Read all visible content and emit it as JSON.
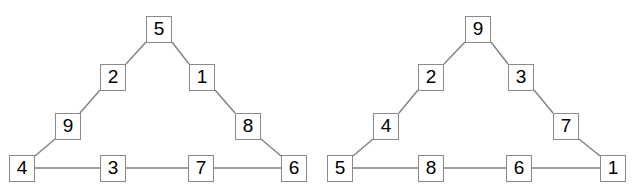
{
  "figure": {
    "title": "",
    "background_color": "#ffffff",
    "edge_color": "#808080",
    "node_border_color": "#8a8a8a",
    "node_fill_color": "#ffffff",
    "digit_color": "#000000",
    "diagram_type": "magic-triangle-pair",
    "panels": [
      {
        "name": "left-triangle",
        "nodes": [
          {
            "id": "L-apex",
            "label": "5",
            "x": 146,
            "y": 16,
            "role": "apex"
          },
          {
            "id": "L-left-upper",
            "label": "2",
            "x": 100,
            "y": 64,
            "role": "left-side"
          },
          {
            "id": "L-right-upper",
            "label": "1",
            "x": 189,
            "y": 64,
            "role": "right-side"
          },
          {
            "id": "L-left-lower",
            "label": "9",
            "x": 55,
            "y": 113,
            "role": "left-side"
          },
          {
            "id": "L-right-lower",
            "label": "8",
            "x": 235,
            "y": 113,
            "role": "right-side"
          },
          {
            "id": "L-bottom-1",
            "label": "4",
            "x": 9,
            "y": 155,
            "role": "corner-bottom-left"
          },
          {
            "id": "L-bottom-2",
            "label": "3",
            "x": 100,
            "y": 155,
            "role": "bottom"
          },
          {
            "id": "L-bottom-3",
            "label": "7",
            "x": 188,
            "y": 155,
            "role": "bottom"
          },
          {
            "id": "L-bottom-4",
            "label": "6",
            "x": 281,
            "y": 155,
            "role": "corner-bottom-right"
          }
        ],
        "edges": [
          {
            "from": "L-bottom-1",
            "to": "L-left-lower",
            "x1": 35,
            "y1": 156,
            "x2": 55,
            "y2": 139
          },
          {
            "from": "L-left-lower",
            "to": "L-left-upper",
            "x1": 80,
            "y1": 113,
            "x2": 100,
            "y2": 90
          },
          {
            "from": "L-left-upper",
            "to": "L-apex",
            "x1": 126,
            "y1": 64,
            "x2": 146,
            "y2": 42
          },
          {
            "from": "L-apex",
            "to": "L-right-upper",
            "x1": 172,
            "y1": 42,
            "x2": 189,
            "y2": 64
          },
          {
            "from": "L-right-upper",
            "to": "L-right-lower",
            "x1": 215,
            "y1": 90,
            "x2": 235,
            "y2": 113
          },
          {
            "from": "L-right-lower",
            "to": "L-bottom-4",
            "x1": 261,
            "y1": 139,
            "x2": 281,
            "y2": 156
          },
          {
            "from": "L-bottom-1",
            "to": "L-bottom-2",
            "x1": 35,
            "y1": 168,
            "x2": 100,
            "y2": 168
          },
          {
            "from": "L-bottom-2",
            "to": "L-bottom-3",
            "x1": 126,
            "y1": 168,
            "x2": 188,
            "y2": 168
          },
          {
            "from": "L-bottom-3",
            "to": "L-bottom-4",
            "x1": 214,
            "y1": 168,
            "x2": 281,
            "y2": 168
          }
        ]
      },
      {
        "name": "right-triangle",
        "nodes": [
          {
            "id": "R-apex",
            "label": "9",
            "x": 465,
            "y": 16,
            "role": "apex"
          },
          {
            "id": "R-left-upper",
            "label": "2",
            "x": 418,
            "y": 64,
            "role": "left-side"
          },
          {
            "id": "R-right-upper",
            "label": "3",
            "x": 508,
            "y": 64,
            "role": "right-side"
          },
          {
            "id": "R-left-lower",
            "label": "4",
            "x": 373,
            "y": 113,
            "role": "left-side"
          },
          {
            "id": "R-right-lower",
            "label": "7",
            "x": 553,
            "y": 113,
            "role": "right-side"
          },
          {
            "id": "R-bottom-1",
            "label": "5",
            "x": 327,
            "y": 155,
            "role": "corner-bottom-left"
          },
          {
            "id": "R-bottom-2",
            "label": "8",
            "x": 418,
            "y": 155,
            "role": "bottom"
          },
          {
            "id": "R-bottom-3",
            "label": "6",
            "x": 506,
            "y": 155,
            "role": "bottom"
          },
          {
            "id": "R-bottom-4",
            "label": "1",
            "x": 600,
            "y": 155,
            "role": "corner-bottom-right"
          }
        ],
        "edges": [
          {
            "from": "R-bottom-1",
            "to": "R-left-lower",
            "x1": 353,
            "y1": 156,
            "x2": 373,
            "y2": 139
          },
          {
            "from": "R-left-lower",
            "to": "R-left-upper",
            "x1": 399,
            "y1": 113,
            "x2": 418,
            "y2": 90
          },
          {
            "from": "R-left-upper",
            "to": "R-apex",
            "x1": 444,
            "y1": 64,
            "x2": 465,
            "y2": 42
          },
          {
            "from": "R-apex",
            "to": "R-right-upper",
            "x1": 491,
            "y1": 42,
            "x2": 508,
            "y2": 64
          },
          {
            "from": "R-right-upper",
            "to": "R-right-lower",
            "x1": 534,
            "y1": 90,
            "x2": 553,
            "y2": 113
          },
          {
            "from": "R-right-lower",
            "to": "R-bottom-4",
            "x1": 579,
            "y1": 139,
            "x2": 600,
            "y2": 156
          },
          {
            "from": "R-bottom-1",
            "to": "R-bottom-2",
            "x1": 353,
            "y1": 168,
            "x2": 418,
            "y2": 168
          },
          {
            "from": "R-bottom-2",
            "to": "R-bottom-3",
            "x1": 444,
            "y1": 168,
            "x2": 506,
            "y2": 168
          },
          {
            "from": "R-bottom-3",
            "to": "R-bottom-4",
            "x1": 532,
            "y1": 168,
            "x2": 600,
            "y2": 168
          }
        ]
      }
    ]
  }
}
